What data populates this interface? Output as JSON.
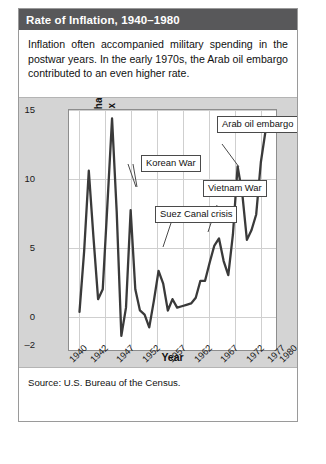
{
  "figure": {
    "title": "Rate of Inflation, 1940–1980",
    "intro": "Inflation often accompanied military spending in the postwar years. In the early 1970s, the Arab oil embargo contributed to an even higher rate.",
    "source": "Source: U.S. Bureau of the Census.",
    "colors": {
      "title_bar": "#58585a",
      "title_text": "#ffffff",
      "panel_background": "#d4d4d4",
      "plot_background": "#ffffff",
      "line": "#3a3a3a",
      "grid": "#cfcfcf"
    }
  },
  "chart_data": {
    "type": "line",
    "title": "Rate of Inflation, 1940–1980",
    "xlabel": "Year",
    "ylabel": "Annual percentage rate of change in consumer price index",
    "xlim": [
      1940,
      1980
    ],
    "ylim": [
      -2,
      15
    ],
    "yticks": [
      15,
      10,
      5,
      0,
      -2
    ],
    "xticks": [
      1940,
      1942,
      1947,
      1952,
      1957,
      1962,
      1967,
      1972,
      1977,
      1980
    ],
    "xtick_labels": [
      "1940",
      "1942",
      "1947",
      "1952",
      "1957",
      "1962",
      "1967",
      "1972",
      "1977",
      "1980"
    ],
    "ytick_labels": [
      "15",
      "10",
      "5",
      "0",
      "–2"
    ],
    "grid": true,
    "legend": "none",
    "series": [
      {
        "name": "Annual percentage rate of change in consumer price index",
        "x": [
          1940,
          1941,
          1942,
          1943,
          1944,
          1945,
          1946,
          1947,
          1948,
          1949,
          1950,
          1951,
          1952,
          1953,
          1954,
          1955,
          1956,
          1957,
          1958,
          1959,
          1960,
          1961,
          1962,
          1963,
          1964,
          1965,
          1966,
          1967,
          1968,
          1969,
          1970,
          1971,
          1972,
          1973,
          1974,
          1975,
          1976,
          1977,
          1978,
          1979,
          1980
        ],
        "values": [
          0.7,
          5.0,
          10.7,
          6.0,
          1.6,
          2.3,
          8.3,
          14.4,
          7.8,
          -1.0,
          1.0,
          7.9,
          2.3,
          0.8,
          0.5,
          -0.4,
          1.5,
          3.6,
          2.7,
          0.8,
          1.6,
          1.0,
          1.1,
          1.2,
          1.3,
          1.7,
          2.9,
          2.9,
          4.2,
          5.4,
          5.9,
          4.3,
          3.3,
          6.2,
          11.0,
          9.1,
          5.8,
          6.5,
          7.6,
          11.3,
          13.5
        ]
      }
    ],
    "annotations": [
      {
        "label": "Korean War",
        "point_year": 1951,
        "point_value": 7.9
      },
      {
        "label": "Suez Canal crisis",
        "point_year": 1957,
        "point_value": 3.6
      },
      {
        "label": "Vietnam War",
        "point_year": 1969,
        "point_value": 5.4
      },
      {
        "label": "Arab oil embargo",
        "point_year": 1974,
        "point_value": 11.0
      }
    ]
  }
}
